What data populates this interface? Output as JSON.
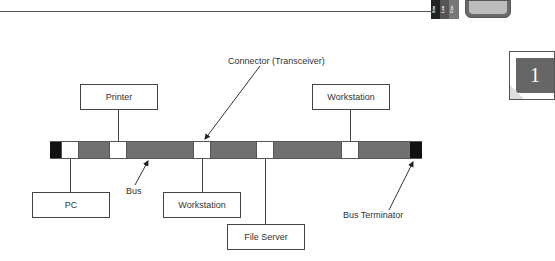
{
  "header": {
    "tabs": [
      "Sim",
      "Lea",
      "Cen"
    ],
    "monitor_icon": "monitor-icon"
  },
  "chapter_badge": {
    "number": "1"
  },
  "diagram": {
    "title_connector": "Connector (Transceiver)",
    "nodes": {
      "printer": "Printer",
      "workstation_top": "Workstation",
      "pc": "PC",
      "workstation_bottom": "Workstation",
      "file_server": "File Server"
    },
    "labels": {
      "bus": "Bus",
      "bus_terminator": "Bus Terminator"
    },
    "colors": {
      "bus_segment": "#707070",
      "terminator": "#111111",
      "connector": "#ffffff"
    }
  }
}
